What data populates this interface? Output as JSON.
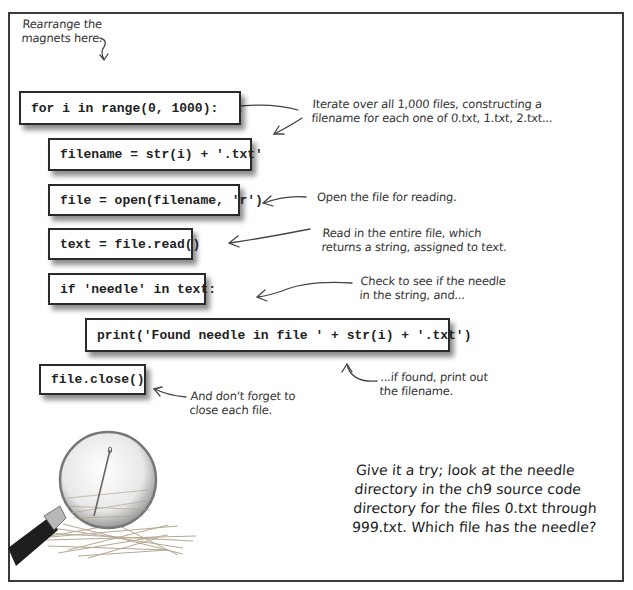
{
  "instruction": {
    "line1": "Rearrange the",
    "line2": "magnets here."
  },
  "magnets": [
    {
      "id": "for-loop",
      "code": "for i in range(0, 1000):"
    },
    {
      "id": "filename",
      "code": "filename = str(i) + '.txt'"
    },
    {
      "id": "open-file",
      "code": "file = open(filename, 'r')"
    },
    {
      "id": "read-file",
      "code": "text = file.read()"
    },
    {
      "id": "if-needle",
      "code": "if 'needle' in text:"
    },
    {
      "id": "print-found",
      "code": "print('Found needle in file ' + str(i) + '.txt')"
    },
    {
      "id": "close-file",
      "code": "file.close()"
    }
  ],
  "annotations": {
    "iterate": {
      "line1": "Iterate over all 1,000 files, constructing a",
      "line2": "filename for each one of 0.txt, 1.txt, 2.txt..."
    },
    "open": {
      "line1": "Open the file for reading."
    },
    "read": {
      "line1": "Read in the entire file, which",
      "line2": "returns a string, assigned to text."
    },
    "check": {
      "line1": "Check to see if the needle",
      "line2": "in the string, and..."
    },
    "print": {
      "line1": "...if found, print out",
      "line2": "the filename."
    },
    "close": {
      "line1": "And don't forget to",
      "line2": "close each file."
    }
  },
  "closing_text": {
    "line1": "Give it a try; look at the needle",
    "line2": "directory in the ch9 source code",
    "line3": "directory for the files 0.txt through",
    "line4": "999.txt. Which file has the needle?"
  },
  "illustration": {
    "description": "magnifying glass over needle in haystack"
  },
  "colors": {
    "border": "#3a3a3a",
    "text": "#222222",
    "background": "#ffffff"
  }
}
